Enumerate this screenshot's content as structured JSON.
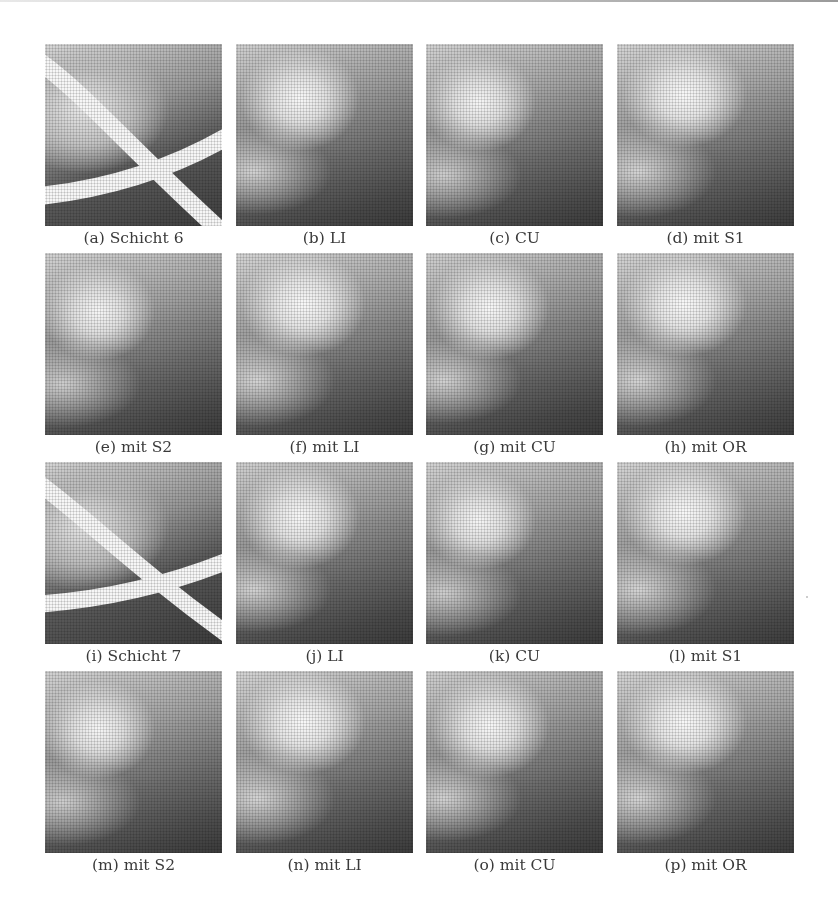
{
  "figure": {
    "rows": [
      {
        "panels": [
          {
            "label": "(a) Schicht 6",
            "kind": "original",
            "style": "bars6"
          },
          {
            "label": "(b) LI",
            "kind": "result",
            "style": "softA"
          },
          {
            "label": "(c) CU",
            "kind": "result",
            "style": "softB"
          },
          {
            "label": "(d) mit S1",
            "kind": "result",
            "style": "softC"
          }
        ]
      },
      {
        "panels": [
          {
            "label": "(e) mit S2",
            "kind": "result",
            "style": "softB"
          },
          {
            "label": "(f) mit LI",
            "kind": "result",
            "style": "softC"
          },
          {
            "label": "(g) mit CU",
            "kind": "result",
            "style": "softA"
          },
          {
            "label": "(h) mit OR",
            "kind": "result",
            "style": "softC"
          }
        ]
      },
      {
        "panels": [
          {
            "label": "(i) Schicht 7",
            "kind": "original",
            "style": "bars7"
          },
          {
            "label": "(j) LI",
            "kind": "result",
            "style": "softA"
          },
          {
            "label": "(k) CU",
            "kind": "result",
            "style": "softB"
          },
          {
            "label": "(l) mit S1",
            "kind": "result",
            "style": "softC"
          }
        ]
      },
      {
        "panels": [
          {
            "label": "(m) mit S2",
            "kind": "result",
            "style": "softB"
          },
          {
            "label": "(n) mit LI",
            "kind": "result",
            "style": "softC"
          },
          {
            "label": "(o) mit CU",
            "kind": "result",
            "style": "softA"
          },
          {
            "label": "(p) mit OR",
            "kind": "result",
            "style": "softC"
          }
        ]
      }
    ]
  },
  "colors": {
    "background": "#ffffff",
    "caption_text": "#3a3a3a",
    "image_dark": "#3c3c3c",
    "image_light": "#f4f4f4"
  }
}
